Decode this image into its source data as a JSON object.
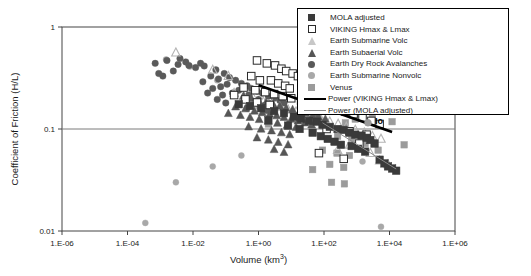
{
  "chart_data": {
    "type": "scatter",
    "title": "",
    "xlabel": "Volume (km3)",
    "ylabel": "Coefficient of Friction (H/L)",
    "xscale": "log",
    "yscale": "log",
    "xlim": [
      1e-06,
      1000000.0
    ],
    "ylim": [
      0.01,
      1
    ],
    "xticks": [
      "1.E-06",
      "1.E-04",
      "1.E-02",
      "1.E+00",
      "1.E+02",
      "1.E+04",
      "1.E+06"
    ],
    "xtick_values": [
      1e-06,
      0.0001,
      0.01,
      1,
      100,
      10000,
      1000000
    ],
    "yticks": [
      "1",
      "0.1",
      "0.01"
    ],
    "ytick_values": [
      1,
      0.1,
      0.01
    ],
    "grid": false,
    "legend_position": "upper-right",
    "annotations": [
      {
        "text": "Io",
        "x": 2200,
        "y": 0.115,
        "marker": "circle",
        "color": "#9a9a9a"
      }
    ],
    "series": [
      {
        "name": "MOLA adjusted",
        "marker": "filled-square",
        "color": "#3a3a3a",
        "points": [
          [
            3.0,
            0.15
          ],
          [
            6.0,
            0.143
          ],
          [
            12.0,
            0.132
          ],
          [
            20.0,
            0.126
          ],
          [
            35.0,
            0.12
          ],
          [
            60.0,
            0.118
          ],
          [
            90.0,
            0.11
          ],
          [
            150.0,
            0.105
          ],
          [
            260.0,
            0.1
          ],
          [
            400.0,
            0.098
          ],
          [
            600.0,
            0.092
          ],
          [
            900.0,
            0.088
          ],
          [
            1400.0,
            0.086
          ],
          [
            2000.0,
            0.082
          ],
          [
            2600.0,
            0.078
          ],
          [
            3500.0,
            0.072
          ],
          [
            1.2,
            0.16
          ],
          [
            0.55,
            0.168
          ],
          [
            0.25,
            0.175
          ],
          [
            700.0,
            0.068
          ],
          [
            1100.0,
            0.064
          ],
          [
            1800.0,
            0.06
          ],
          [
            5000.0,
            0.05
          ],
          [
            7000.0,
            0.046
          ],
          [
            9000.0,
            0.043
          ],
          [
            12000.0,
            0.041
          ],
          [
            16000.0,
            0.039
          ],
          [
            45.0,
            0.092
          ],
          [
            80.0,
            0.085
          ],
          [
            130.0,
            0.08
          ],
          [
            210.0,
            0.075
          ],
          [
            330.0,
            0.07
          ],
          [
            8.0,
            0.108
          ],
          [
            18.0,
            0.1
          ],
          [
            2.0,
            0.122
          ]
        ]
      },
      {
        "name": "VIKING Hmax & Lmax",
        "marker": "open-square",
        "color": "#2a2a2a",
        "points": [
          [
            0.9,
            0.47
          ],
          [
            1.8,
            0.44
          ],
          [
            3.2,
            0.42
          ],
          [
            5.0,
            0.39
          ],
          [
            7.0,
            0.37
          ],
          [
            11.0,
            0.35
          ],
          [
            16.0,
            0.33
          ],
          [
            24.0,
            0.31
          ],
          [
            2.4,
            0.3
          ],
          [
            4.0,
            0.28
          ],
          [
            6.5,
            0.265
          ],
          [
            9.0,
            0.25
          ],
          [
            0.6,
            0.33
          ],
          [
            1.1,
            0.3
          ],
          [
            30.0,
            0.29
          ],
          [
            50.0,
            0.27
          ],
          [
            0.35,
            0.255
          ],
          [
            0.8,
            0.24
          ],
          [
            1.6,
            0.23
          ],
          [
            3.0,
            0.22
          ],
          [
            5.5,
            0.21
          ],
          [
            10.0,
            0.2
          ],
          [
            20.0,
            0.19
          ],
          [
            40.0,
            0.18
          ],
          [
            75.0,
            0.175
          ],
          [
            140.0,
            0.165
          ],
          [
            250.0,
            0.155
          ],
          [
            450.0,
            0.148
          ],
          [
            800.0,
            0.14
          ],
          [
            1500.0,
            0.13
          ],
          [
            2800.0,
            0.12
          ],
          [
            5000.0,
            0.112
          ],
          [
            0.18,
            0.215
          ],
          [
            0.4,
            0.195
          ],
          [
            0.9,
            0.182
          ],
          [
            2.2,
            0.172
          ],
          [
            120.0,
            0.1
          ],
          [
            600.0,
            0.095
          ],
          [
            2000.0,
            0.088
          ],
          [
            1200.0,
            0.072
          ],
          [
            70.0,
            0.058
          ],
          [
            400.0,
            0.051
          ]
        ]
      },
      {
        "name": "Earth Submarine Volc",
        "marker": "open-triangle",
        "color": "#b4b4b4",
        "points": [
          [
            0.003,
            0.56
          ],
          [
            0.04,
            0.38
          ],
          [
            0.12,
            0.33
          ],
          [
            0.7,
            0.2
          ],
          [
            1.4,
            0.185
          ],
          [
            2.6,
            0.175
          ],
          [
            4.5,
            0.165
          ],
          [
            8.0,
            0.155
          ],
          [
            14.0,
            0.148
          ],
          [
            25.0,
            0.14
          ],
          [
            45.0,
            0.132
          ],
          [
            80.0,
            0.125
          ],
          [
            150.0,
            0.118
          ],
          [
            270.0,
            0.112
          ],
          [
            480.0,
            0.105
          ],
          [
            900.0,
            0.098
          ],
          [
            1700.0,
            0.092
          ],
          [
            3000.0,
            0.085
          ],
          [
            5500.0,
            0.08
          ],
          [
            0.35,
            0.21
          ],
          [
            0.18,
            0.225
          ],
          [
            600.0,
            0.07
          ],
          [
            1400.0,
            0.064
          ],
          [
            2600.0,
            0.058
          ],
          [
            260.0,
            0.062
          ],
          [
            5000.0,
            0.049
          ],
          [
            9000.0,
            0.045
          ]
        ]
      },
      {
        "name": "Earth Subaerial Volc",
        "marker": "filled-triangle",
        "color": "#565656",
        "points": [
          [
            0.35,
            0.21
          ],
          [
            0.6,
            0.2
          ],
          [
            1.0,
            0.19
          ],
          [
            1.7,
            0.182
          ],
          [
            2.8,
            0.175
          ],
          [
            4.5,
            0.168
          ],
          [
            7.0,
            0.16
          ],
          [
            11.0,
            0.155
          ],
          [
            18.0,
            0.148
          ],
          [
            28.0,
            0.142
          ],
          [
            45.0,
            0.136
          ],
          [
            70.0,
            0.13
          ],
          [
            110.0,
            0.125
          ],
          [
            0.2,
            0.165
          ],
          [
            0.4,
            0.158
          ],
          [
            0.75,
            0.15
          ],
          [
            1.3,
            0.145
          ],
          [
            2.2,
            0.14
          ],
          [
            3.6,
            0.135
          ],
          [
            6.0,
            0.13
          ],
          [
            10.0,
            0.125
          ],
          [
            16.0,
            0.12
          ],
          [
            26.0,
            0.115
          ],
          [
            42.0,
            0.11
          ],
          [
            0.12,
            0.142
          ],
          [
            0.28,
            0.136
          ],
          [
            0.55,
            0.13
          ],
          [
            1.05,
            0.124
          ],
          [
            2.0,
            0.119
          ],
          [
            3.8,
            0.114
          ],
          [
            7.5,
            0.109
          ],
          [
            14.0,
            0.104
          ],
          [
            0.5,
            0.105
          ],
          [
            1.2,
            0.1
          ],
          [
            2.5,
            0.096
          ],
          [
            5.0,
            0.092
          ],
          [
            9.0,
            0.088
          ],
          [
            0.9,
            0.082
          ],
          [
            2.0,
            0.078
          ],
          [
            4.0,
            0.074
          ],
          [
            8.0,
            0.07
          ],
          [
            3.0,
            0.063
          ],
          [
            6.0,
            0.059
          ]
        ]
      },
      {
        "name": "Earth Dry Rock Avalanches",
        "marker": "filled-circle",
        "color": "#5a5a5a",
        "points": [
          [
            0.0007,
            0.44
          ],
          [
            0.0016,
            0.47
          ],
          [
            0.0035,
            0.43
          ],
          [
            0.004,
            0.49
          ],
          [
            0.006,
            0.455
          ],
          [
            0.0075,
            0.42
          ],
          [
            0.012,
            0.4
          ],
          [
            0.017,
            0.44
          ],
          [
            0.022,
            0.415
          ],
          [
            0.0009,
            0.35
          ],
          [
            0.0025,
            0.37
          ],
          [
            0.05,
            0.38
          ],
          [
            0.09,
            0.35
          ],
          [
            0.06,
            0.31
          ],
          [
            0.035,
            0.33
          ],
          [
            0.13,
            0.32
          ],
          [
            0.2,
            0.3
          ],
          [
            0.11,
            0.275
          ],
          [
            0.07,
            0.26
          ],
          [
            0.04,
            0.25
          ],
          [
            0.3,
            0.28
          ],
          [
            0.45,
            0.265
          ],
          [
            0.25,
            0.24
          ],
          [
            0.16,
            0.225
          ],
          [
            0.08,
            0.215
          ],
          [
            0.6,
            0.25
          ],
          [
            0.9,
            0.235
          ],
          [
            0.5,
            0.215
          ],
          [
            0.35,
            0.2
          ],
          [
            1.3,
            0.225
          ],
          [
            2.0,
            0.21
          ],
          [
            1.0,
            0.195
          ],
          [
            0.7,
            0.185
          ],
          [
            3.0,
            0.2
          ],
          [
            4.5,
            0.19
          ],
          [
            2.2,
            0.178
          ],
          [
            1.5,
            0.17
          ],
          [
            6.0,
            0.18
          ],
          [
            0.02,
            0.29
          ],
          [
            0.028,
            0.225
          ],
          [
            0.055,
            0.195
          ],
          [
            0.1,
            0.18
          ],
          [
            0.45,
            0.16
          ],
          [
            1.8,
            0.152
          ],
          [
            60.0,
            0.132
          ],
          [
            0.0012,
            0.33
          ]
        ]
      },
      {
        "name": "Earth Submarine Nonvolc",
        "marker": "light-circle",
        "color": "#a8a8a8",
        "points": [
          [
            0.0015,
            0.48
          ],
          [
            0.008,
            0.41
          ],
          [
            0.055,
            0.3
          ],
          [
            0.35,
            0.195
          ],
          [
            1.0,
            0.165
          ],
          [
            3.0,
            0.15
          ],
          [
            0.003,
            0.03
          ],
          [
            0.04,
            0.043
          ],
          [
            0.3,
            0.055
          ],
          [
            1500.0,
            0.048
          ],
          [
            0.00035,
            0.012
          ],
          [
            5500.0,
            0.011
          ],
          [
            2200.0,
            0.115
          ]
        ]
      },
      {
        "name": "Venus",
        "marker": "gray-square",
        "color": "#9b9b9b",
        "points": [
          [
            1600.0,
            0.165
          ],
          [
            6000.0,
            0.16
          ],
          [
            3000.0,
            0.13
          ],
          [
            900.0,
            0.125
          ],
          [
            450.0,
            0.115
          ],
          [
            12000.0,
            0.118
          ],
          [
            260.0,
            0.085
          ],
          [
            700.0,
            0.078
          ],
          [
            1800.0,
            0.072
          ],
          [
            90.0,
            0.062
          ],
          [
            250.0,
            0.058
          ],
          [
            600.0,
            0.055
          ],
          [
            28000.0,
            0.07
          ],
          [
            150.0,
            0.045
          ],
          [
            400.0,
            0.042
          ],
          [
            45.0,
            0.04
          ],
          [
            4500.0,
            0.062
          ],
          [
            170.0,
            0.03
          ],
          [
            420.0,
            0.029
          ],
          [
            2.0,
            0.112
          ]
        ]
      }
    ],
    "trendlines": [
      {
        "name": "Power (VIKING Hmax & Lmax)",
        "style": "thick",
        "color": "#000000",
        "width": 2.6,
        "x0": 1.0,
        "y0": 0.268,
        "x1": 12000.0,
        "y1": 0.0935
      },
      {
        "name": "Power (MOLA adjusted)",
        "style": "thin",
        "color": "#888888",
        "width": 1.0,
        "x0": 90.0,
        "y0": 0.115,
        "x1": 16000.0,
        "y1": 0.0405
      }
    ]
  },
  "legend": {
    "entries": [
      {
        "label": "MOLA adjusted",
        "marker": "filled-square",
        "color": "#3a3a3a"
      },
      {
        "label": "VIKING Hmax & Lmax",
        "marker": "open-square",
        "color": "#2a2a2a"
      },
      {
        "label": "Earth Submarine Volc",
        "marker": "open-triangle",
        "color": "#b4b4b4"
      },
      {
        "label": "Earth Subaerial Volc",
        "marker": "filled-triangle",
        "color": "#565656"
      },
      {
        "label": "Earth Dry Rock Avalanches",
        "marker": "filled-circle",
        "color": "#5a5a5a"
      },
      {
        "label": "Earth Submarine Nonvolc",
        "marker": "light-circle",
        "color": "#a8a8a8"
      },
      {
        "label": "Venus",
        "marker": "gray-square",
        "color": "#9b9b9b"
      },
      {
        "label": "Power (VIKING Hmax & Lmax)",
        "marker": "thick-line",
        "color": "#000000"
      },
      {
        "label": "Power (MOLA adjusted)",
        "marker": "thin-line",
        "color": "#888888"
      }
    ]
  },
  "axes": {
    "ylabel": "Coefficient of Friction (H/L)",
    "xlabel_base": "Volume (km",
    "xlabel_sup": "3",
    "xlabel_close": ")"
  }
}
